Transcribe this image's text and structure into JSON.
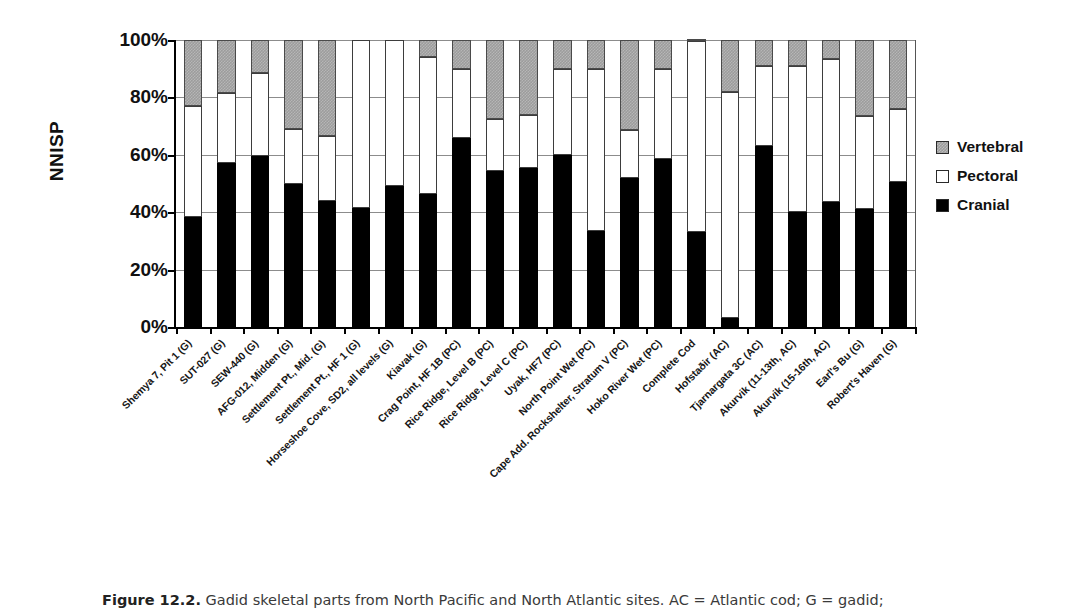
{
  "chart_data": {
    "type": "bar",
    "subtype": "stacked-percent",
    "title": "",
    "xlabel": "",
    "ylabel": "NNISP",
    "ylim": [
      0,
      100
    ],
    "ytick_labels": [
      "0%",
      "20%",
      "40%",
      "60%",
      "80%",
      "100%"
    ],
    "ytick_values": [
      0,
      20,
      40,
      60,
      80,
      100
    ],
    "grid": true,
    "legend_position": "right",
    "legend": [
      "Vertebral",
      "Pectoral",
      "Cranial"
    ],
    "categories": [
      "Shemya 7, Pit 1 (G)",
      "SUT-027 (G)",
      "SEW-440 (G)",
      "AFG-012, Midden (G)",
      "Settlement Pt., Mid. (G)",
      "Settlement Pt., HF 1 (G)",
      "Horseshoe Cove, SD2, all levels (G)",
      "Kiavak (G)",
      "Crag Point, HF 1B (PC)",
      "Rice Ridge, Level B (PC)",
      "Rice Ridge, Level C (PC)",
      "Uyak, HF7 (PC)",
      "North Point Wet (PC)",
      "Cape Add. Rockshelter, Stratum V (PC)",
      "Hoko River Wet (PC)",
      "Complete Cod",
      "Hofstaðir (AC)",
      "Tjarnargata 3C (AC)",
      "Akurvik (11-13th, AC)",
      "Akurvik (15-16th, AC)",
      "Earl's Bu (G)",
      "Robert's Haven (G)"
    ],
    "series": [
      {
        "name": "Cranial",
        "color": "#000000",
        "values": [
          38.5,
          57,
          59.5,
          50,
          44,
          41.5,
          49,
          46.5,
          66,
          54.5,
          55.5,
          60,
          33.5,
          52,
          58.5,
          33,
          3,
          63,
          40,
          43.5,
          41,
          50.5
        ]
      },
      {
        "name": "Pectoral",
        "color": "#ffffff",
        "values": [
          38.5,
          24.5,
          29,
          19,
          22.5,
          58.5,
          51,
          47.5,
          24,
          18,
          18.5,
          30,
          56.5,
          16.5,
          31.5,
          66.5,
          79,
          28,
          51,
          50,
          32.5,
          25.5
        ]
      },
      {
        "name": "Vertebral",
        "color": "#9c9c9c",
        "values": [
          23,
          18.5,
          11.5,
          31,
          33.5,
          0,
          0,
          6,
          10,
          27.5,
          26,
          10,
          10,
          31.5,
          10,
          0.5,
          18,
          9,
          9,
          6.5,
          26.5,
          24
        ]
      }
    ],
    "cumulative_tops": {
      "note": "Stacked cumulative top of each segment, percent",
      "cranial": [
        38.5,
        57,
        59.5,
        50,
        44,
        41.5,
        49,
        46.5,
        66,
        54.5,
        55.5,
        60,
        33.5,
        52,
        58.5,
        33,
        3,
        63,
        40,
        43.5,
        41,
        50.5
      ],
      "pectoral": [
        77,
        81.5,
        88.5,
        69,
        66.5,
        100,
        100,
        94,
        90,
        72.5,
        74,
        90,
        90,
        68.5,
        90,
        99.5,
        82,
        91,
        91,
        93.5,
        73.5,
        76
      ],
      "vertebral": [
        100,
        100,
        100,
        100,
        100,
        100,
        100,
        100,
        100,
        100,
        100,
        100,
        100,
        100,
        100,
        100,
        100,
        100,
        100,
        100,
        100,
        100
      ]
    }
  },
  "legend": {
    "items": [
      {
        "label": "Vertebral",
        "key": "vertebral"
      },
      {
        "label": "Pectoral",
        "key": "pectoral"
      },
      {
        "label": "Cranial",
        "key": "cranial"
      }
    ]
  },
  "axis": {
    "y_title": "NNISP"
  },
  "caption": {
    "figure_number": "Figure 12.2.",
    "text": " Gadid skeletal parts from North Pacific and North Atlantic sites. AC = Atlantic cod; G = gadid;"
  }
}
